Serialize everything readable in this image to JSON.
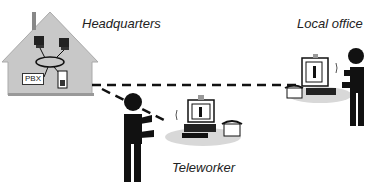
{
  "diagram": {
    "nodes": [
      {
        "id": "hq",
        "label": "Headquarters"
      },
      {
        "id": "local",
        "label": "Local office"
      },
      {
        "id": "tele",
        "label": "Teleworker"
      }
    ],
    "hq_internal": {
      "pbx_label": "PBX"
    },
    "edges": [
      {
        "from": "hq",
        "to": "local",
        "style": "dashed"
      },
      {
        "from": "hq",
        "to": "tele",
        "style": "dashed"
      }
    ],
    "colors": {
      "house": "#c8c8c8",
      "figure": "#111111",
      "shadow": "#d8d8d8"
    }
  }
}
